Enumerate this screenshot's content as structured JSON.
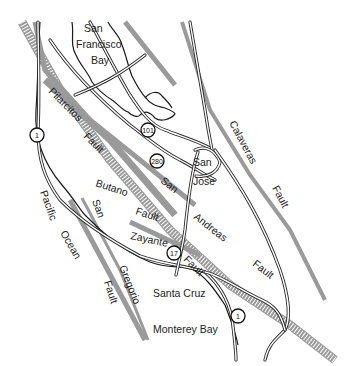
{
  "map": {
    "title": "San Andreas fault zone near San Francisco Bay and Monterey Bay",
    "colors": {
      "fault": "#9a9a9a",
      "road": "#2a2a2a",
      "background": "#ffffff"
    },
    "water_labels": {
      "sf_bay_1": "San",
      "sf_bay_2": "Francisco",
      "sf_bay_3": "Bay",
      "pacific_1": "Pacific",
      "pacific_2": "Ocean",
      "monterey": "Monterey Bay"
    },
    "city_labels": {
      "san_jose_1": "San",
      "san_jose_2": "Jose",
      "santa_cruz": "Santa Cruz"
    },
    "fault_labels": {
      "pilarcitos_1": "Pilarcitos",
      "pilarcitos_2": "Fault",
      "calaveras_1": "Calaveras",
      "calaveras_2": "Fault",
      "san_andreas_1": "San",
      "san_andreas_2": "Andreas",
      "san_andreas_3": "Fault",
      "butano_1": "Butano",
      "butano_2": "Fault",
      "zayante_1": "Zayante",
      "zayante_2": "Fault",
      "san_gregorio_1": "San",
      "san_gregorio_2": "Gregorio",
      "san_gregorio_3": "Fault"
    },
    "highways": {
      "hwy1_north": "1",
      "hwy101": "101",
      "hwy280": "280",
      "hwy17": "17",
      "hwy1_south": "1"
    }
  }
}
